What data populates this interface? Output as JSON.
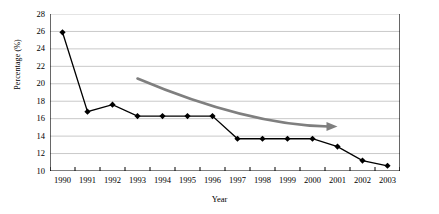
{
  "chart_data": {
    "type": "line",
    "title": "",
    "xlabel": "Year",
    "ylabel": "Percentage (%)",
    "categories": [
      "1990",
      "1991",
      "1992",
      "1993",
      "1994",
      "1995",
      "1996",
      "1997",
      "1998",
      "1999",
      "2000",
      "2001",
      "2002",
      "2003"
    ],
    "values": [
      25.9,
      16.8,
      17.6,
      16.3,
      16.3,
      16.3,
      16.3,
      13.7,
      13.7,
      13.7,
      13.7,
      12.8,
      11.2,
      10.6
    ],
    "series": [
      {
        "name": "Percentage",
        "values": [
          25.9,
          16.8,
          17.6,
          16.3,
          16.3,
          16.3,
          16.3,
          13.7,
          13.7,
          13.7,
          13.7,
          12.8,
          11.2,
          10.6
        ],
        "color": "#000000",
        "marker": "diamond"
      }
    ],
    "ylim": [
      10,
      28
    ],
    "yticks": [
      10,
      12,
      14,
      16,
      18,
      20,
      22,
      24,
      26,
      28
    ],
    "ytick_labels": [
      "10",
      "12",
      "14",
      "16",
      "18",
      "20",
      "22",
      "24",
      "26",
      "28"
    ],
    "grid": true,
    "gridline_color": "#c9c9c9",
    "legend": false,
    "annotations": [
      {
        "name": "downward-trend-arrow",
        "type": "curved-arrow",
        "color": "#7f7f7f",
        "start_year": "1993",
        "start_value": 20.6,
        "end_year": "2001",
        "end_value": 15.1
      }
    ]
  },
  "axis": {
    "y_title": "Percentage (%)",
    "x_title": "Year"
  }
}
